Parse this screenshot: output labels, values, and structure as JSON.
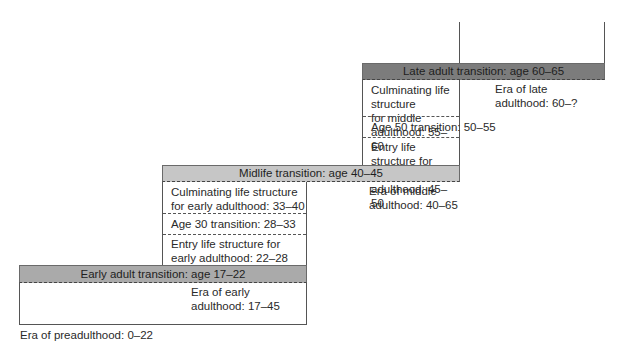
{
  "diagram": {
    "title": "",
    "eras": [
      {
        "label": "Era of preadulthood: 0–22"
      },
      {
        "label": "Era of early\nadulthood: 17–45"
      },
      {
        "label": "Era of middle\nadulthood: 40–65"
      },
      {
        "label": "Era of late\nadulthood: 60–?"
      }
    ],
    "transitions": [
      {
        "label": "Early adult transition: age 17–22",
        "color": "#aaaaaa"
      },
      {
        "label": "Midlife transition: age 40–45",
        "color": "#c6c6c6"
      },
      {
        "label": "Late adult transition: age 60–65",
        "color": "#7c7c7c"
      }
    ],
    "early_adulthood_periods": [
      {
        "label": "Culminating life structure\nfor early adulthood: 33–40"
      },
      {
        "label": "Age 30 transition: 28–33"
      },
      {
        "label": "Entry life structure for\nearly adulthood: 22–28"
      }
    ],
    "middle_adulthood_periods": [
      {
        "label": "Culminating life structure\nfor middle adulthood: 55–60"
      },
      {
        "label": "Age 50 transition: 50–55"
      },
      {
        "label": "Entry life structure for\nmiddle adulthood: 45–50"
      }
    ]
  }
}
